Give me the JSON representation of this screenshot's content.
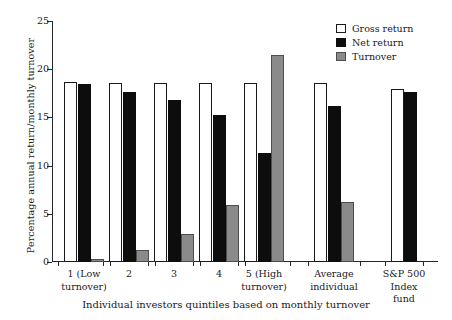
{
  "chart_data": {
    "type": "bar",
    "title": "",
    "xlabel": "Individual investors quintiles based on monthly turnover",
    "ylabel": "Percentage annual return/monthly turnover",
    "ylim": [
      0,
      25
    ],
    "yticks": [
      0,
      5,
      10,
      15,
      20,
      25
    ],
    "ytick_labels": [
      "0",
      "5",
      "10",
      "15",
      "20",
      "25"
    ],
    "grid": false,
    "legend_position": "top-right",
    "categories": [
      "1 (Low\nturnover)",
      "2",
      "3",
      "4",
      "5 (High\nturnover)",
      "Average\nindividual",
      "S&P 500\nIndex\nfund"
    ],
    "series": [
      {
        "name": "Gross return",
        "color": "#ffffff",
        "values": [
          18.7,
          18.6,
          18.6,
          18.6,
          18.6,
          18.6,
          17.9
        ]
      },
      {
        "name": "Net return",
        "color": "#0d0d0d",
        "values": [
          18.5,
          17.6,
          16.8,
          15.2,
          11.3,
          16.2,
          17.6
        ]
      },
      {
        "name": "Turnover",
        "color": "#8a8a8a",
        "values": [
          0.3,
          1.2,
          2.9,
          5.9,
          21.5,
          6.2,
          null
        ]
      }
    ]
  },
  "legend": {
    "items": [
      {
        "label": "Gross return",
        "swatch": "gross"
      },
      {
        "label": "Net return",
        "swatch": "net"
      },
      {
        "label": "Turnover",
        "swatch": "turnover"
      }
    ]
  }
}
